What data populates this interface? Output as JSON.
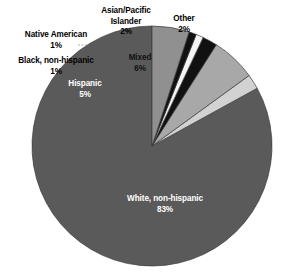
{
  "chart_data": {
    "type": "pie",
    "title": "",
    "subtitle": "",
    "xlabel": "",
    "ylabel": "",
    "legend_position": "none",
    "grid": false,
    "categories": [
      "White, non-hispanic",
      "Hispanic",
      "Black, non-hispanic",
      "Native American",
      "Asian/Pacific Islander",
      "Mixed",
      "Other"
    ],
    "values": [
      83,
      5,
      1,
      1,
      2,
      6,
      2
    ],
    "value_labels": [
      "83%",
      "5%",
      "1%",
      "1%",
      "2%",
      "6%",
      "2%"
    ],
    "units": "percent",
    "start_angle_deg": 90,
    "direction": "counterclockwise",
    "slices": [
      {
        "name": "White, non-hispanic",
        "value": 83,
        "value_label": "83%",
        "color": "#5a5a5a",
        "label_placement": "inside",
        "label_color": "#ffffff"
      },
      {
        "name": "Other",
        "value": 2,
        "value_label": "2%",
        "color": "#d2d2d2",
        "label_placement": "outside",
        "label_color": "#000000"
      },
      {
        "name": "Mixed",
        "value": 6,
        "value_label": "6%",
        "color": "#a8a8a8",
        "label_placement": "inside",
        "label_color": "#111111"
      },
      {
        "name": "Asian/Pacific Islander",
        "value": 2,
        "value_label": "2%",
        "color": "#111111",
        "label_placement": "outside",
        "label_color": "#000000"
      },
      {
        "name": "Native American",
        "value": 1,
        "value_label": "1%",
        "color": "#f4f4f4",
        "label_placement": "outside",
        "label_color": "#000000"
      },
      {
        "name": "Black, non-hispanic",
        "value": 1,
        "value_label": "1%",
        "color": "#111111",
        "label_placement": "outside",
        "label_color": "#000000"
      },
      {
        "name": "Hispanic",
        "value": 5,
        "value_label": "5%",
        "color": "#909090",
        "label_placement": "inside",
        "label_color": "#ffffff"
      }
    ]
  },
  "labels": {
    "native_american": {
      "name": "Native American",
      "pct": "1%"
    },
    "black_nonhispanic": {
      "name": "Black, non-hispanic",
      "pct": "1%"
    },
    "asian_pacific_line1": "Asian/Pacific",
    "asian_pacific_line2": "Islander",
    "asian_pacific_pct": "2%",
    "other": {
      "name": "Other",
      "pct": "2%"
    },
    "hispanic": {
      "name": "Hispanic",
      "pct": "5%"
    },
    "mixed": {
      "name": "Mixed",
      "pct": "6%"
    },
    "white_nonhispanic": {
      "name": "White, non-hispanic",
      "pct": "83%"
    }
  },
  "colors": {
    "background": "#ffffff",
    "white_nonhispanic": "#5a5a5a",
    "hispanic": "#909090",
    "black_nonhispanic": "#111111",
    "native_american": "#f4f4f4",
    "asian_pacific": "#111111",
    "mixed": "#a8a8a8",
    "other": "#d2d2d2",
    "outline": "#3c3c3c",
    "leader_line": "#8a8a8a"
  }
}
